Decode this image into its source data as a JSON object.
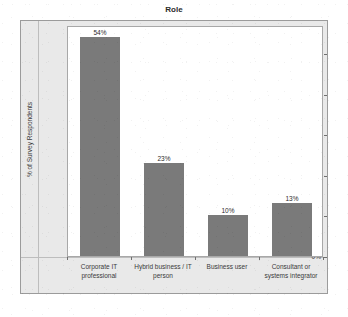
{
  "chart_data": {
    "type": "bar",
    "title": "Role",
    "xlabel": "",
    "ylabel": "% of Survey Respondents",
    "categories": [
      "Corporate IT professional",
      "Hybrid business / IT person",
      "Business user",
      "Consultant or systems integrator"
    ],
    "values": [
      54,
      23,
      10,
      13
    ],
    "data_labels": [
      "54%",
      "23%",
      "10%",
      "13%"
    ],
    "ylim": [
      0,
      57
    ],
    "yticks": [
      0,
      10,
      20,
      30,
      40,
      50
    ],
    "ytick_labels": [
      "0%",
      "10%",
      "20%",
      "30%",
      "40%",
      "50%"
    ],
    "grid": false,
    "legend": false,
    "bar_color": "#7a7a7a",
    "plot_background": "#ffffff",
    "frame_background": "#e9e9e9"
  }
}
